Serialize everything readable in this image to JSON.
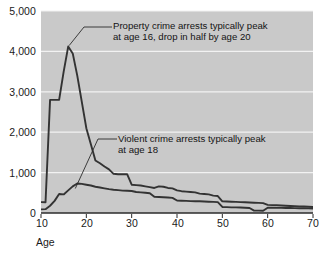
{
  "chart_data": {
    "type": "line",
    "title": "",
    "xlabel": "Age",
    "ylabel": "",
    "xlim": [
      10,
      70
    ],
    "ylim": [
      0,
      5000
    ],
    "grid": true,
    "legend": "none",
    "plot_background": "#c9c9c9",
    "line_color": "#333333",
    "gridline_color": "#f2f2f2",
    "xticks": [
      "10",
      "20",
      "30",
      "40",
      "50",
      "60",
      "70"
    ],
    "xtick_values": [
      10,
      20,
      30,
      40,
      50,
      60,
      70
    ],
    "yticks": [
      "0",
      "1,000",
      "2,000",
      "3,000",
      "4,000",
      "5,000"
    ],
    "ytick_values": [
      0,
      1000,
      2000,
      3000,
      4000,
      5000
    ],
    "x": [
      10,
      11,
      12,
      13,
      14,
      15,
      16,
      17,
      18,
      19,
      20,
      21,
      22,
      23,
      24,
      25,
      26,
      27,
      28,
      29,
      30,
      31,
      32,
      33,
      34,
      35,
      36,
      37,
      38,
      39,
      40,
      41,
      42,
      43,
      44,
      45,
      46,
      47,
      48,
      49,
      50,
      51,
      52,
      53,
      54,
      55,
      56,
      57,
      58,
      59,
      60,
      61,
      62,
      63,
      64,
      65,
      66,
      67,
      68,
      69,
      70
    ],
    "series": [
      {
        "name": "Property crime arrests",
        "values": [
          270,
          265,
          2800,
          2800,
          2800,
          3500,
          4120,
          3950,
          3400,
          2750,
          2100,
          1700,
          1300,
          1230,
          1150,
          1080,
          970,
          960,
          960,
          960,
          700,
          690,
          680,
          660,
          640,
          620,
          660,
          650,
          620,
          610,
          560,
          540,
          530,
          520,
          510,
          480,
          470,
          460,
          430,
          420,
          290,
          285,
          280,
          275,
          270,
          265,
          260,
          255,
          250,
          245,
          200,
          195,
          190,
          185,
          180,
          175,
          170,
          165,
          160,
          155,
          150
        ]
      },
      {
        "name": "Violent crime arrests",
        "values": [
          90,
          95,
          180,
          300,
          470,
          460,
          560,
          660,
          730,
          720,
          700,
          680,
          650,
          630,
          610,
          590,
          575,
          565,
          555,
          550,
          545,
          520,
          510,
          500,
          490,
          400,
          395,
          390,
          385,
          375,
          310,
          305,
          300,
          295,
          290,
          290,
          285,
          280,
          275,
          270,
          150,
          145,
          140,
          138,
          135,
          130,
          125,
          60,
          58,
          55,
          130,
          130,
          128,
          126,
          124,
          122,
          120,
          118,
          116,
          114,
          112
        ]
      }
    ],
    "annotations": [
      {
        "id": "property-annotation",
        "lines": [
          "Property crime arrests typically peak",
          "at age 16, drop in half by age 20"
        ],
        "target_x": 16,
        "target_y": 4120
      },
      {
        "id": "violent-annotation",
        "lines": [
          "Violent crime arrests typically peak",
          "at age 18"
        ],
        "target_x": 18,
        "target_y": 730
      }
    ]
  }
}
